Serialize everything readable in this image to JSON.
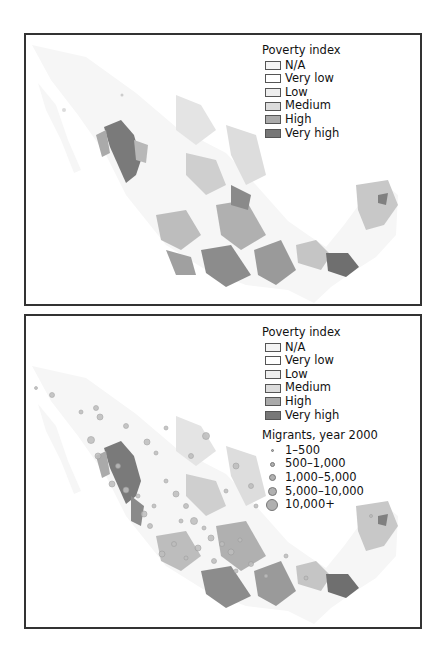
{
  "panels": [
    {
      "id": "top",
      "legend": {
        "title": "Poverty index",
        "classes": [
          {
            "label": "N/A",
            "color": "#f4f4f4"
          },
          {
            "label": "Very low",
            "color": "#ffffff"
          },
          {
            "label": "Low",
            "color": "#eeeeee"
          },
          {
            "label": "Medium",
            "color": "#dcdcdc"
          },
          {
            "label": "High",
            "color": "#aaaaaa"
          },
          {
            "label": "Very high",
            "color": "#777777"
          }
        ]
      }
    },
    {
      "id": "bottom",
      "legend": {
        "title": "Poverty index",
        "classes": [
          {
            "label": "N/A",
            "color": "#f4f4f4"
          },
          {
            "label": "Very low",
            "color": "#ffffff"
          },
          {
            "label": "Low",
            "color": "#eeeeee"
          },
          {
            "label": "Medium",
            "color": "#dcdcdc"
          },
          {
            "label": "High",
            "color": "#aaaaaa"
          },
          {
            "label": "Very high",
            "color": "#777777"
          }
        ],
        "migrants": {
          "title": "Migrants, year 2000",
          "classes": [
            {
              "label": "1–500",
              "size": 3
            },
            {
              "label": "500–1,000",
              "size": 5
            },
            {
              "label": "1,000–5,000",
              "size": 7
            },
            {
              "label": "5,000–10,000",
              "size": 9
            },
            {
              "label": "10,000+",
              "size": 12
            }
          ]
        }
      }
    }
  ]
}
